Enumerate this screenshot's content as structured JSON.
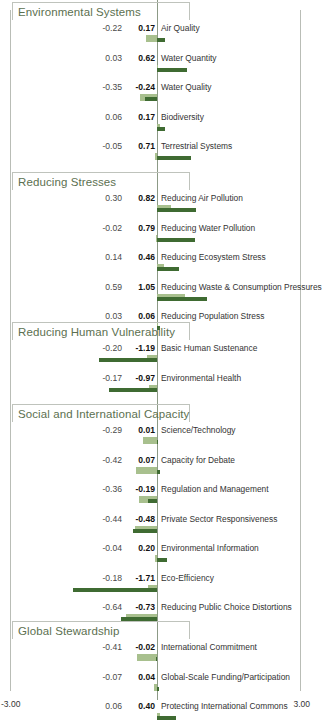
{
  "axis": {
    "min_label": "-3.00",
    "max_label": "3.00",
    "min": -3.0,
    "max": 3.0
  },
  "colors": {
    "bar_light": "#a8c08e",
    "bar_dark": "#3f6b32",
    "section_title": "#5c7050",
    "frame": "#bfc3bc",
    "zero_axis": "#8c9a86"
  },
  "sections": [
    {
      "title": "Environmental Systems",
      "rows": [
        {
          "value_a": "-0.22",
          "value_b": "0.17",
          "name": "Air Quality",
          "a": -0.22,
          "b": 0.17
        },
        {
          "value_a": "0.03",
          "value_b": "0.62",
          "name": "Water Quantity",
          "a": 0.03,
          "b": 0.62
        },
        {
          "value_a": "-0.35",
          "value_b": "-0.24",
          "name": "Water Quality",
          "a": -0.35,
          "b": -0.24
        },
        {
          "value_a": "0.06",
          "value_b": "0.17",
          "name": "Biodiversity",
          "a": 0.06,
          "b": 0.17
        },
        {
          "value_a": "-0.05",
          "value_b": "0.71",
          "name": "Terrestrial Systems",
          "a": -0.05,
          "b": 0.71
        }
      ]
    },
    {
      "title": "Reducing Stresses",
      "rows": [
        {
          "value_a": "0.30",
          "value_b": "0.82",
          "name": "Reducing Air Pollution",
          "a": 0.3,
          "b": 0.82
        },
        {
          "value_a": "-0.02",
          "value_b": "0.79",
          "name": "Reducing Water Pollution",
          "a": -0.02,
          "b": 0.79
        },
        {
          "value_a": "0.14",
          "value_b": "0.46",
          "name": "Reducing Ecosystem Stress",
          "a": 0.14,
          "b": 0.46
        },
        {
          "value_a": "0.59",
          "value_b": "1.05",
          "name": "Reducing Waste & Consumption Pressures",
          "a": 0.59,
          "b": 1.05
        },
        {
          "value_a": "0.03",
          "value_b": "0.06",
          "name": "Reducing Population Stress",
          "a": 0.03,
          "b": 0.06
        }
      ]
    },
    {
      "title": "Reducing Human Vulnerability",
      "rows": [
        {
          "value_a": "-0.20",
          "value_b": "-1.19",
          "name": "Basic Human Sustenance",
          "a": -0.2,
          "b": -1.19
        },
        {
          "value_a": "-0.17",
          "value_b": "-0.97",
          "name": "Environmental Health",
          "a": -0.17,
          "b": -0.97
        }
      ]
    },
    {
      "title": "Social and International Capacity",
      "rows": [
        {
          "value_a": "-0.29",
          "value_b": "0.01",
          "name": "Science/Technology",
          "a": -0.29,
          "b": 0.01
        },
        {
          "value_a": "-0.42",
          "value_b": "0.07",
          "name": "Capacity for Debate",
          "a": -0.42,
          "b": 0.07
        },
        {
          "value_a": "-0.36",
          "value_b": "-0.19",
          "name": "Regulation and Management",
          "a": -0.36,
          "b": -0.19
        },
        {
          "value_a": "-0.44",
          "value_b": "-0.48",
          "name": "Private Sector Responsiveness",
          "a": -0.44,
          "b": -0.48
        },
        {
          "value_a": "-0.04",
          "value_b": "0.20",
          "name": "Environmental Information",
          "a": -0.04,
          "b": 0.2
        },
        {
          "value_a": "-0.18",
          "value_b": "-1.71",
          "name": "Eco-Efficiency",
          "a": -0.18,
          "b": -1.71
        },
        {
          "value_a": "-0.64",
          "value_b": "-0.73",
          "name": "Reducing Public Choice Distortions",
          "a": -0.64,
          "b": -0.73
        }
      ]
    },
    {
      "title": "Global Stewardship",
      "rows": [
        {
          "value_a": "-0.41",
          "value_b": "-0.02",
          "name": "International Commitment",
          "a": -0.41,
          "b": -0.02
        },
        {
          "value_a": "-0.07",
          "value_b": "0.04",
          "name": "Global-Scale Funding/Participation",
          "a": -0.07,
          "b": 0.04
        },
        {
          "value_a": "0.06",
          "value_b": "0.40",
          "name": "Protecting International Commons",
          "a": 0.06,
          "b": 0.4
        }
      ]
    }
  ],
  "chart_data": {
    "type": "bar",
    "title": "",
    "xlabel": "",
    "ylabel": "",
    "xlim": [
      -3.0,
      3.0
    ],
    "grid": false,
    "legend": null,
    "orientation": "horizontal",
    "zero_reference": 0,
    "series": [
      {
        "name": "light-green (first value)",
        "color": "#a8c08e"
      },
      {
        "name": "dark-green (second value, bold)",
        "color": "#3f6b32"
      }
    ],
    "categories": [
      "Air Quality",
      "Water Quantity",
      "Water Quality",
      "Biodiversity",
      "Terrestrial Systems",
      "Reducing Air Pollution",
      "Reducing Water Pollution",
      "Reducing Ecosystem Stress",
      "Reducing Waste & Consumption Pressures",
      "Reducing Population Stress",
      "Basic Human Sustenance",
      "Environmental Health",
      "Science/Technology",
      "Capacity for Debate",
      "Regulation and Management",
      "Private Sector Responsiveness",
      "Environmental Information",
      "Eco-Efficiency",
      "Reducing Public Choice Distortions",
      "International Commitment",
      "Global-Scale Funding/Participation",
      "Protecting International Commons"
    ],
    "values_light": [
      -0.22,
      0.03,
      -0.35,
      0.06,
      -0.05,
      0.3,
      -0.02,
      0.14,
      0.59,
      0.03,
      -0.2,
      -0.17,
      -0.29,
      -0.42,
      -0.36,
      -0.44,
      -0.04,
      -0.18,
      -0.64,
      -0.41,
      -0.07,
      0.06
    ],
    "values_dark": [
      0.17,
      0.62,
      -0.24,
      0.17,
      0.71,
      0.82,
      0.79,
      0.46,
      1.05,
      0.06,
      -1.19,
      -0.97,
      0.01,
      0.07,
      -0.19,
      -0.48,
      0.2,
      -1.71,
      -0.73,
      -0.02,
      0.04,
      0.4
    ],
    "groups": [
      "Environmental Systems",
      "Reducing Stresses",
      "Reducing Human Vulnerability",
      "Social and International Capacity",
      "Global Stewardship"
    ]
  }
}
